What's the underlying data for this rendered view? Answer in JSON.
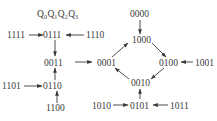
{
  "diagram": {
    "type": "state-transition",
    "header": {
      "letters": [
        "Q",
        "Q",
        "Q",
        "Q"
      ],
      "subscripts": [
        "0",
        "1",
        "2",
        "3"
      ]
    },
    "states": {
      "s1111": "1111",
      "s0111": "0111",
      "s1110": "1110",
      "s0011": "0011",
      "s1101": "1101",
      "s0110": "0110",
      "s1100": "1100",
      "s0000": "0000",
      "s1000": "1000",
      "s0001": "0001",
      "s0100": "0100",
      "s1001": "1001",
      "s0010": "0010",
      "s1010": "1010",
      "s0101": "0101",
      "s1011": "1011"
    },
    "edges": [
      [
        "1111",
        "0111"
      ],
      [
        "1110",
        "0111"
      ],
      [
        "0111",
        "0011"
      ],
      [
        "1101",
        "0110"
      ],
      [
        "1100",
        "0110"
      ],
      [
        "0110",
        "0011"
      ],
      [
        "0011",
        "0001"
      ],
      [
        "0000",
        "1000"
      ],
      [
        "0001",
        "1000"
      ],
      [
        "1000",
        "0100"
      ],
      [
        "1001",
        "0100"
      ],
      [
        "0100",
        "0010"
      ],
      [
        "0010",
        "0001"
      ],
      [
        "1010",
        "0101"
      ],
      [
        "1011",
        "0101"
      ],
      [
        "0101",
        "0010"
      ]
    ],
    "colors": {
      "ink": "#3a3a3a",
      "background": "#ffffff"
    }
  }
}
